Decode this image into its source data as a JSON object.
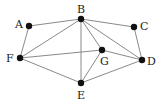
{
  "graph": {
    "nodes": [
      {
        "id": "A",
        "label": "A",
        "x": 29,
        "y": 26,
        "lx": 15,
        "ly": 28
      },
      {
        "id": "B",
        "label": "B",
        "x": 81,
        "y": 19,
        "lx": 77,
        "ly": 13
      },
      {
        "id": "C",
        "label": "C",
        "x": 134,
        "y": 27,
        "lx": 140,
        "ly": 30
      },
      {
        "id": "D",
        "label": "D",
        "x": 142,
        "y": 60,
        "lx": 147,
        "ly": 65
      },
      {
        "id": "E",
        "label": "E",
        "x": 81,
        "y": 83,
        "lx": 77,
        "ly": 99
      },
      {
        "id": "F",
        "label": "F",
        "x": 20,
        "y": 58,
        "lx": 6,
        "ly": 62
      },
      {
        "id": "G",
        "label": "G",
        "x": 102,
        "y": 50,
        "lx": 100,
        "ly": 65
      }
    ],
    "edges": [
      [
        "A",
        "B"
      ],
      [
        "A",
        "F"
      ],
      [
        "B",
        "C"
      ],
      [
        "B",
        "F"
      ],
      [
        "B",
        "E"
      ],
      [
        "B",
        "G"
      ],
      [
        "B",
        "D"
      ],
      [
        "C",
        "D"
      ],
      [
        "F",
        "G"
      ],
      [
        "F",
        "E"
      ],
      [
        "G",
        "D"
      ],
      [
        "G",
        "E"
      ],
      [
        "E",
        "D"
      ]
    ]
  }
}
